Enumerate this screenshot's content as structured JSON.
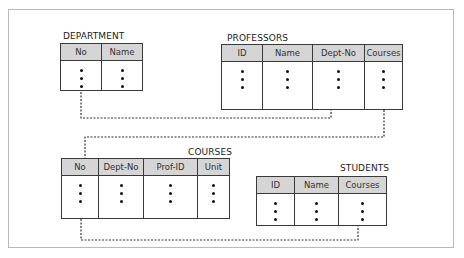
{
  "diagram": {
    "type": "relational-schema",
    "tables": [
      {
        "id": "department",
        "title": "DEPARTMENT",
        "columns": [
          {
            "label": "No",
            "values": [
              "•",
              "•",
              "•"
            ]
          },
          {
            "label": "Name",
            "values": [
              "•",
              "•",
              "•"
            ]
          }
        ]
      },
      {
        "id": "professors",
        "title": "PROFESSORS",
        "columns": [
          {
            "label": "ID",
            "values": [
              "•",
              "•",
              "•"
            ]
          },
          {
            "label": "Name",
            "values": [
              "•",
              "•",
              "•"
            ]
          },
          {
            "label": "Dept-No",
            "values": [
              "•",
              "•",
              "•"
            ]
          },
          {
            "label": "Courses",
            "values": [
              "•",
              "•",
              "•"
            ]
          }
        ]
      },
      {
        "id": "courses",
        "title": "COURSES",
        "columns": [
          {
            "label": "No",
            "values": [
              "•",
              "•",
              "•"
            ]
          },
          {
            "label": "Dept-No",
            "values": [
              "•",
              "•",
              "•"
            ]
          },
          {
            "label": "Prof-ID",
            "values": [
              "•",
              "•",
              "•"
            ]
          },
          {
            "label": "Unit",
            "values": [
              "•",
              "•",
              "•"
            ]
          }
        ]
      },
      {
        "id": "students",
        "title": "STUDENTS",
        "columns": [
          {
            "label": "ID",
            "values": [
              "•",
              "•",
              "•"
            ]
          },
          {
            "label": "Name",
            "values": [
              "•",
              "•",
              "•"
            ]
          },
          {
            "label": "Courses",
            "values": [
              "•",
              "•",
              "•"
            ]
          }
        ]
      }
    ],
    "links": [
      {
        "from": "DEPARTMENT.No",
        "to": "PROFESSORS.Dept-No",
        "style": "dashed"
      },
      {
        "from": "PROFESSORS.Courses",
        "to": "COURSES.No",
        "style": "dashed"
      },
      {
        "from": "COURSES.No",
        "to": "STUDENTS.Courses",
        "style": "dashed"
      }
    ],
    "colors": {
      "header_fill": "#d5d5d5",
      "border": "#3a3a3a",
      "frame": "#b9b9b9",
      "link": "#333333"
    }
  }
}
